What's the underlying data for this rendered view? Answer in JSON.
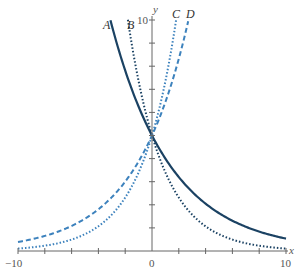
{
  "chart_data": {
    "type": "line",
    "title": "",
    "xlabel": "x",
    "ylabel": "y",
    "xlim": [
      -10,
      10
    ],
    "ylim": [
      0,
      10
    ],
    "x_tick_labels": [
      "-10",
      "0",
      "10"
    ],
    "y_tick_labels": [
      "10"
    ],
    "x_ticks_every": 2,
    "y_ticks_every": 1,
    "grid": false,
    "legend": "inline curve labels A, B, C, D at top",
    "series": [
      {
        "name": "A",
        "formula": "y = 5(0.8)^x",
        "a": 5,
        "base": 0.8,
        "x_range": [
          -3.1,
          10
        ],
        "style": "solid",
        "color": "#1b4263"
      },
      {
        "name": "B",
        "formula": "y = 5(0.68)^x",
        "a": 5,
        "base": 0.68,
        "x_range": [
          -1.8,
          10
        ],
        "style": "dotted",
        "color": "#1b4263"
      },
      {
        "name": "C",
        "formula": "y = 5(1.47)^x",
        "a": 5,
        "base": 1.47,
        "x_range": [
          -10,
          1.8
        ],
        "style": "dotted",
        "color": "#3d82bd"
      },
      {
        "name": "D",
        "formula": "y = 5(1.29)^x",
        "a": 5,
        "base": 1.29,
        "x_range": [
          -10,
          2.7
        ],
        "style": "dashed",
        "color": "#3d82bd"
      }
    ],
    "sample_points": {
      "A": [
        [
          -3,
          9.77
        ],
        [
          0,
          5
        ],
        [
          2,
          3.2
        ],
        [
          5,
          1.64
        ],
        [
          10,
          0.54
        ]
      ],
      "B": [
        [
          -1.8,
          10
        ],
        [
          0,
          5
        ],
        [
          2,
          2.31
        ],
        [
          5,
          0.73
        ],
        [
          10,
          0.11
        ]
      ],
      "C": [
        [
          -10,
          0.11
        ],
        [
          -5,
          0.73
        ],
        [
          0,
          5
        ],
        [
          1.8,
          10
        ]
      ],
      "D": [
        [
          -10,
          0.39
        ],
        [
          -5,
          1.4
        ],
        [
          0,
          5
        ],
        [
          2.7,
          10
        ]
      ]
    }
  },
  "labels": {
    "x_axis": "x",
    "y_axis": "y",
    "x_min": "−10",
    "x_zero": "0",
    "x_max": "10",
    "y_max": "10",
    "curve_a": "A",
    "curve_b": "B",
    "curve_c": "C",
    "curve_d": "D"
  }
}
